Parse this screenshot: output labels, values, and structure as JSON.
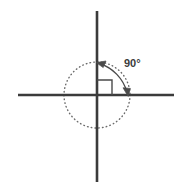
{
  "diagram": {
    "canvas": {
      "width": 188,
      "height": 196,
      "background": "#ffffff"
    },
    "colors": {
      "axis": "#3b3b3b",
      "circle": "#6b6b6b",
      "arc": "#4a4a4a",
      "square": "#4a4a4a",
      "label": "#3b3b3b"
    },
    "origin": {
      "x": 97,
      "y": 95
    },
    "x_axis": {
      "x1": 18,
      "y1": 95,
      "x2": 174,
      "y2": 95,
      "stroke_width": 2.6
    },
    "y_axis": {
      "x1": 97,
      "y1": 11,
      "x2": 97,
      "y2": 182,
      "stroke_width": 2.6
    },
    "circle": {
      "cx": 97,
      "cy": 95,
      "r": 33,
      "style": "dotted",
      "stroke_width": 1.4
    },
    "right_angle_marker": {
      "x": 97,
      "y": 80,
      "size": 15,
      "quadrant": "upper-right"
    },
    "angle_arc": {
      "start": {
        "x": 97,
        "y": 62
      },
      "end": {
        "x": 128,
        "y": 95
      },
      "radius": 42,
      "arrow_both_ends": true,
      "stroke_width": 1.3
    },
    "angle_label": {
      "text": "90°",
      "x": 124,
      "y": 66
    }
  }
}
